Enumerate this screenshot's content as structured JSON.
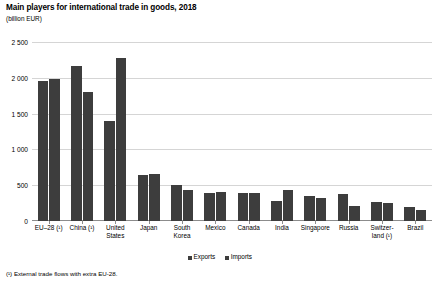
{
  "chart_data": {
    "type": "bar",
    "title": "Main players for international trade in goods, 2018",
    "subtitle": "(billion EUR)",
    "xlabel": "",
    "ylabel": "",
    "unit": "billion EUR",
    "grid": true,
    "legend_position": "bottom",
    "ylim": [
      0,
      2500
    ],
    "yticks": [
      0,
      500,
      1000,
      1500,
      2000,
      2500
    ],
    "ytick_labels": [
      "0",
      "500",
      "1 000",
      "1 500",
      "2 000",
      "2 500"
    ],
    "categories": [
      "EU–28 (¹)",
      "China (¹)",
      "United States",
      "Japan",
      "South Korea",
      "Mexico",
      "Canada",
      "India",
      "Singapore",
      "Russia",
      "Switzer-land (¹)",
      "Brazil"
    ],
    "category_lines": [
      [
        "EU–28 (¹)"
      ],
      [
        "China (¹)"
      ],
      [
        "United",
        "States"
      ],
      [
        "Japan"
      ],
      [
        "South",
        "Korea"
      ],
      [
        "Mexico"
      ],
      [
        "Canada"
      ],
      [
        "India"
      ],
      [
        "Singapore"
      ],
      [
        "Russia"
      ],
      [
        "Switzer-",
        "land (¹)"
      ],
      [
        "Brazil"
      ]
    ],
    "series": [
      {
        "name": "Exports",
        "color": "#3d3d3d",
        "values": [
          1956,
          2160,
          1400,
          640,
          500,
          395,
          395,
          280,
          350,
          380,
          270,
          200
        ]
      },
      {
        "name": "Imports",
        "color": "#3d3d3d",
        "values": [
          1980,
          1800,
          2270,
          650,
          440,
          400,
          395,
          430,
          320,
          210,
          250,
          160
        ]
      }
    ],
    "footnote": "(¹) External trade flows with extra EU-28."
  },
  "legend": {
    "items": [
      {
        "label": "Exports"
      },
      {
        "label": "Imports"
      }
    ]
  }
}
